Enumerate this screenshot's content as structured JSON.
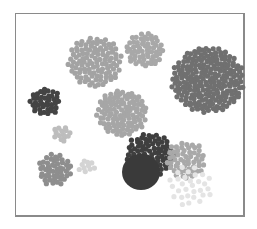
{
  "diagram": {
    "type": "dot-cluster",
    "frame": {
      "x": 15,
      "y": 13,
      "width": 231,
      "height": 205,
      "border_color": "#8a8a8a"
    },
    "dot_radius": 2.6,
    "clusters": [
      {
        "id": "cluster-top-left-large",
        "cx": 95,
        "cy": 62,
        "r": 27,
        "count": 110,
        "color": "#a3a3a3"
      },
      {
        "id": "cluster-top-center",
        "cx": 145,
        "cy": 50,
        "r": 19,
        "count": 60,
        "color": "#a8a8a8"
      },
      {
        "id": "cluster-right-large",
        "cx": 208,
        "cy": 80,
        "r": 36,
        "count": 230,
        "color": "#707070"
      },
      {
        "id": "cluster-left-dark",
        "cx": 45,
        "cy": 102,
        "r": 15,
        "count": 40,
        "color": "#444444"
      },
      {
        "id": "cluster-center-mid",
        "cx": 122,
        "cy": 113,
        "r": 25,
        "count": 110,
        "color": "#a6a6a6"
      },
      {
        "id": "cluster-small-light",
        "cx": 62,
        "cy": 134,
        "r": 9,
        "count": 14,
        "color": "#bdbdbd"
      },
      {
        "id": "cluster-bottom-left",
        "cx": 55,
        "cy": 170,
        "r": 17,
        "count": 50,
        "color": "#8e8e8e"
      },
      {
        "id": "cluster-tiny-pale",
        "cx": 87,
        "cy": 166,
        "r": 8,
        "count": 10,
        "color": "#d4d4d4"
      },
      {
        "id": "cluster-dark-arc",
        "cx": 150,
        "cy": 155,
        "r": 24,
        "count": 90,
        "color": "#3f3f3f"
      },
      {
        "id": "cluster-right-gray",
        "cx": 186,
        "cy": 160,
        "r": 20,
        "count": 55,
        "color": "#a9a9a9"
      },
      {
        "id": "cluster-faint-bottom-right",
        "cx": 190,
        "cy": 186,
        "r": 22,
        "count": 30,
        "color": "#e4e4e4"
      }
    ],
    "solid_circles": [
      {
        "id": "big-dark-disc",
        "cx": 141,
        "cy": 172,
        "r": 19,
        "color": "#3a3a3a"
      }
    ]
  }
}
